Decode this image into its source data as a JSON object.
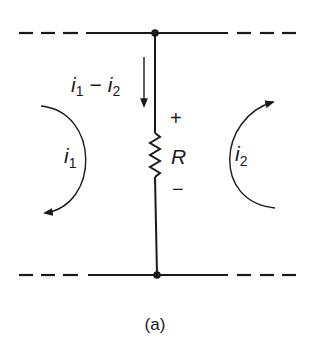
{
  "diagram": {
    "type": "circuit",
    "caption": "(a)",
    "branch_current_label": {
      "a": "i",
      "a_sub": "1",
      "op": "−",
      "b": "i",
      "b_sub": "2"
    },
    "resistor_label": "R",
    "polarity": {
      "plus": "+",
      "minus": "−"
    },
    "loop_left": {
      "label": "i",
      "sub": "1",
      "direction": "clockwise"
    },
    "loop_right": {
      "label": "i",
      "sub": "2",
      "direction": "clockwise"
    },
    "colors": {
      "ink": "#1a1a1a",
      "background": "#ffffff"
    }
  }
}
